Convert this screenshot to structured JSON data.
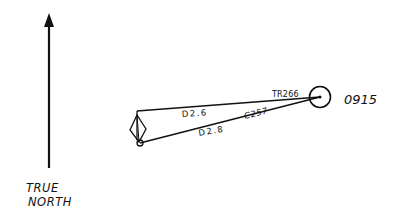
{
  "diagram": {
    "north_label_line1": "TRUE",
    "north_label_line2": "NORTH",
    "time_label": "0915",
    "true_range_label": "TR266",
    "course_label": "C257",
    "distance_upper_label": "D2.6",
    "distance_lower_label": "D2.8",
    "colors": {
      "ink": "#111111",
      "background": "#ffffff"
    }
  }
}
